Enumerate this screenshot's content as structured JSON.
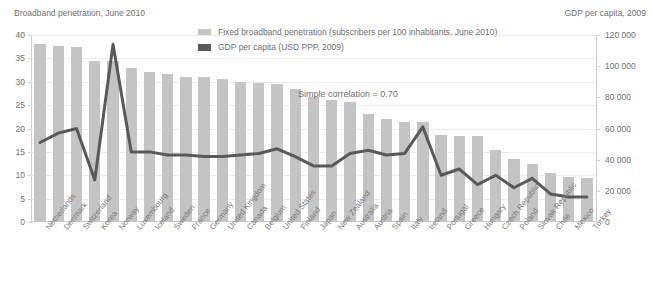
{
  "chart_data": {
    "type": "bar",
    "title": "",
    "left_axis_title": "Broadband penetration, June 2010",
    "right_axis_title": "GDP per capita, 2009",
    "xlabel": "",
    "ylabel": "",
    "ylim": [
      0,
      40
    ],
    "y2lim": [
      0,
      120000
    ],
    "yticks": [
      "0",
      "5",
      "10",
      "15",
      "20",
      "25",
      "30",
      "35",
      "40"
    ],
    "ytick_values": [
      0,
      5,
      10,
      15,
      20,
      25,
      30,
      35,
      40
    ],
    "y2ticks": [
      "0",
      "20 000",
      "40 000",
      "60 000",
      "80 000",
      "100 000",
      "120 000"
    ],
    "y2tick_values": [
      0,
      20000,
      40000,
      60000,
      80000,
      100000,
      120000
    ],
    "grid": true,
    "legend_position": "top-center",
    "annotations": [
      {
        "text": "Simple correlation = 0.70",
        "x_index": 17,
        "y_value": 28.5
      }
    ],
    "categories": [
      "Netherlands",
      "Denmark",
      "Switzerland",
      "Korea",
      "Norway",
      "Luxembourg",
      "Iceland",
      "Sweden",
      "France",
      "Germany",
      "United Kingdom",
      "Canada",
      "Belgium",
      "United States",
      "Finland",
      "Japan",
      "New Zealand",
      "Australia",
      "Austria",
      "Spain",
      "Italy",
      "Ireland",
      "Portugal",
      "Greece",
      "Hungary",
      "Czech Republic",
      "Poland",
      "Slovak Republic",
      "Chile",
      "Mexico",
      "Turkey"
    ],
    "series": [
      {
        "name": "Fixed broadband penetration (subscribers per 100 inhabitants, June 2010)",
        "type": "bar",
        "axis": "left",
        "color": "#c4c4c4",
        "values": [
          38.0,
          37.6,
          37.5,
          34.4,
          34.4,
          32.9,
          32.0,
          31.6,
          31.0,
          31.0,
          30.6,
          30.0,
          29.8,
          29.6,
          28.5,
          26.7,
          26.1,
          25.7,
          23.1,
          22.1,
          21.3,
          21.3,
          18.6,
          18.5,
          18.5,
          15.5,
          13.4,
          12.4,
          10.4,
          9.7,
          9.5
        ]
      },
      {
        "name": "GDP per capita (USD PPP, 2009)",
        "type": "line",
        "axis": "right",
        "color": "#595959",
        "values": [
          51000,
          57000,
          60000,
          27000,
          114000,
          45000,
          45000,
          43000,
          43000,
          42000,
          42000,
          43000,
          44000,
          47000,
          42000,
          36000,
          36000,
          44000,
          46000,
          43000,
          44000,
          61000,
          30000,
          34000,
          24000,
          30000,
          22000,
          28000,
          18000,
          16000,
          16000
        ]
      }
    ]
  },
  "legend": {
    "items": [
      {
        "label": "Fixed broadband penetration (subscribers per 100 inhabitants, June 2010)",
        "color": "#c4c4c4"
      },
      {
        "label": "GDP per capita (USD PPP, 2009)",
        "color": "#595959"
      }
    ]
  }
}
